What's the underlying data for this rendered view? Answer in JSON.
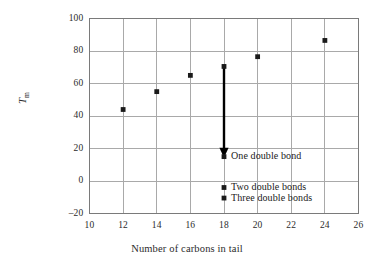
{
  "chart_data": {
    "type": "scatter",
    "title": "",
    "xlabel": "Number of carbons in tail",
    "ylabel": "T_m",
    "ylabel_base": "T",
    "ylabel_sub": "m",
    "xlim": [
      10,
      26
    ],
    "ylim": [
      -20,
      100
    ],
    "xticks": [
      10,
      12,
      14,
      16,
      18,
      20,
      22,
      24,
      26
    ],
    "yticks": [
      100,
      80,
      60,
      40,
      20,
      0,
      -20
    ],
    "xtick_labels": [
      "10",
      "12",
      "14",
      "16",
      "18",
      "20",
      "22",
      "24",
      "26"
    ],
    "ytick_labels": [
      "100",
      "80",
      "60",
      "40",
      "20",
      "0",
      "–20"
    ],
    "grid": true,
    "legend": "none",
    "series": [
      {
        "name": "Saturated tails",
        "marker": "square",
        "color": "#1a1a1a",
        "x": [
          12,
          14,
          16,
          18,
          20,
          24
        ],
        "y": [
          44,
          55,
          65,
          70.5,
          76.5,
          86.5
        ]
      },
      {
        "name": "One double bond",
        "marker": "square",
        "color": "#1a1a1a",
        "x": [
          18
        ],
        "y": [
          15
        ]
      },
      {
        "name": "Two double bonds",
        "marker": "square",
        "color": "#1a1a1a",
        "x": [
          18
        ],
        "y": [
          -4
        ]
      },
      {
        "name": "Three double bonds",
        "marker": "square",
        "color": "#1a1a1a",
        "x": [
          18
        ],
        "y": [
          -10.5
        ]
      }
    ],
    "annotations": [
      {
        "text": "One double bond",
        "x": 18,
        "y": 15
      },
      {
        "text": "Two double bonds",
        "x": 18,
        "y": -4
      },
      {
        "text": "Three double bonds",
        "x": 18,
        "y": -10.5
      }
    ],
    "arrow": {
      "x": 18,
      "y_from": 70.5,
      "y_to": 15,
      "color": "#000000"
    }
  },
  "colors": {
    "axis": "#7a7a7a",
    "grid": "#a9a9a9",
    "marker": "#1a1a1a",
    "text": "#2b2b2b",
    "background": "#ffffff"
  }
}
